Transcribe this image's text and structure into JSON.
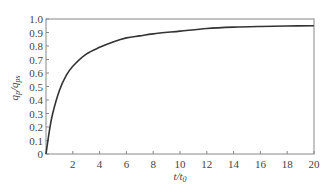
{
  "chart_data": {
    "type": "line",
    "title": "",
    "xlabel": "t/t0",
    "ylabel": "qp/qps",
    "xlim": [
      0,
      20
    ],
    "ylim": [
      0,
      1.0
    ],
    "grid": false,
    "legend": null,
    "x_ticks": [
      2,
      4,
      6,
      8,
      10,
      12,
      14,
      16,
      18,
      20
    ],
    "x_tick_labels": [
      "2",
      "4",
      "6",
      "8",
      "10",
      "12",
      "14",
      "16",
      "18",
      "20"
    ],
    "y_ticks": [
      0,
      0.1,
      0.2,
      0.3,
      0.4,
      0.5,
      0.6,
      0.7,
      0.8,
      0.9,
      1.0
    ],
    "y_tick_labels": [
      "0",
      "0.1",
      "0.2",
      "0.3",
      "0.4",
      "0.5",
      "0.6",
      "0.7",
      "0.8",
      "0.9",
      "1.0"
    ],
    "series": [
      {
        "name": "qp/qps",
        "color": "#333333",
        "x": [
          0,
          0.25,
          0.5,
          1,
          1.5,
          2,
          3,
          4,
          5,
          6,
          7,
          8,
          10,
          12,
          14,
          16,
          18,
          20
        ],
        "y": [
          0.0,
          0.17,
          0.3,
          0.47,
          0.58,
          0.65,
          0.74,
          0.79,
          0.83,
          0.86,
          0.875,
          0.89,
          0.91,
          0.93,
          0.94,
          0.945,
          0.948,
          0.95
        ]
      }
    ]
  }
}
